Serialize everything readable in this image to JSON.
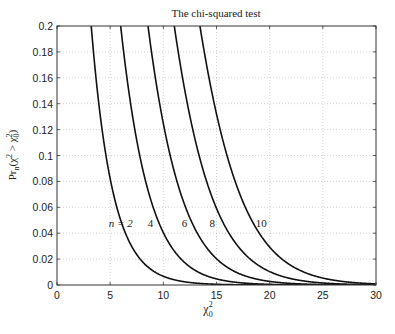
{
  "chart_data": {
    "type": "line",
    "title": "The chi-squared test",
    "xlabel": "χ₀²",
    "ylabel": "Prₙ(χ² > χ₀²)",
    "xlim": [
      0,
      30
    ],
    "ylim": [
      0,
      0.2
    ],
    "xticks": [
      0,
      5,
      10,
      15,
      20,
      25,
      30
    ],
    "yticks": [
      0,
      0.02,
      0.04,
      0.06,
      0.08,
      0.1,
      0.12,
      0.14,
      0.16,
      0.18,
      0.2
    ],
    "xtick_labels": [
      "0",
      "5",
      "10",
      "15",
      "20",
      "25",
      "30"
    ],
    "ytick_labels": [
      "0",
      "0.02",
      "0.04",
      "0.06",
      "0.08",
      "0.1",
      "0.12",
      "0.14",
      "0.16",
      "0.18",
      "0.2"
    ],
    "grid": true,
    "legend": "inline labels",
    "series": [
      {
        "name": "n = 2",
        "dof": 2,
        "label": "n = 2",
        "label_pos": [
          6.0,
          0.048
        ],
        "x": [
          3.22,
          4,
          5,
          6,
          8,
          10,
          12,
          15,
          20,
          30
        ],
        "values": [
          0.2,
          0.135,
          0.082,
          0.05,
          0.018,
          0.0067,
          0.0025,
          0.00055,
          5e-05,
          0.0
        ]
      },
      {
        "name": "n = 4",
        "dof": 4,
        "label": "4",
        "label_pos": [
          8.8,
          0.048
        ],
        "x": [
          5.99,
          7,
          8,
          10,
          12,
          15,
          20,
          30
        ],
        "values": [
          0.2,
          0.136,
          0.092,
          0.04,
          0.017,
          0.0047,
          0.0005,
          0.0
        ]
      },
      {
        "name": "n = 6",
        "dof": 6,
        "label": "6",
        "label_pos": [
          12.0,
          0.048
        ],
        "x": [
          8.56,
          10,
          12,
          14,
          16,
          20,
          25,
          30
        ],
        "values": [
          0.2,
          0.125,
          0.062,
          0.03,
          0.014,
          0.003,
          0.0003,
          0.0
        ]
      },
      {
        "name": "n = 8",
        "dof": 8,
        "label": "8",
        "label_pos": [
          14.6,
          0.048
        ],
        "x": [
          11.03,
          12,
          14,
          16,
          18,
          20,
          25,
          30
        ],
        "values": [
          0.2,
          0.151,
          0.082,
          0.042,
          0.021,
          0.01,
          0.0016,
          0.0002
        ]
      },
      {
        "name": "n = 10",
        "dof": 10,
        "label": "10",
        "label_pos": [
          19.2,
          0.048
        ],
        "x": [
          13.44,
          15,
          16,
          18,
          20,
          22,
          25,
          30
        ],
        "values": [
          0.2,
          0.132,
          0.1,
          0.055,
          0.029,
          0.015,
          0.0053,
          0.0008
        ]
      }
    ],
    "colors": {
      "line": "#111111",
      "grid": "#c8c8c8",
      "axis": "#333333"
    }
  }
}
